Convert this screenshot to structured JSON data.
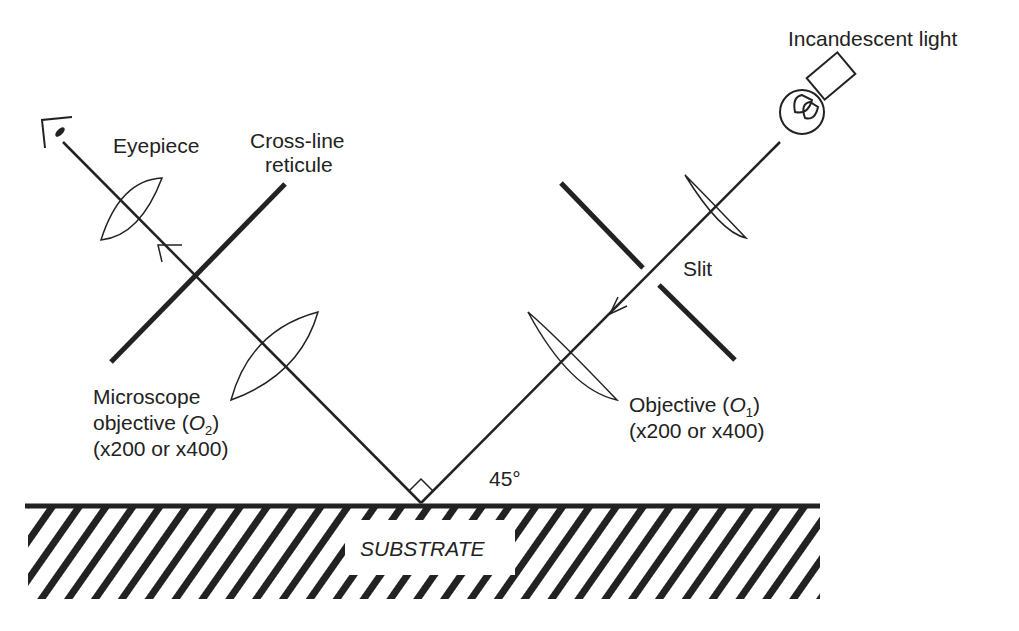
{
  "diagram": {
    "type": "optical-microscope-setup",
    "labels": {
      "incandescent_light": "Incandescent light",
      "eyepiece": "Eyepiece",
      "reticule_line1": "Cross-line",
      "reticule_line2": "reticule",
      "slit": "Slit",
      "micro_obj_line1": "Microscope",
      "micro_obj_line2_prefix": "objective (",
      "micro_obj_symbol": "O",
      "micro_obj_subscript": "2",
      "micro_obj_suffix": ")",
      "micro_obj_line3": "(x200 or x400)",
      "obj1_line1_prefix": "Objective (",
      "obj1_symbol": "O",
      "obj1_subscript": "1",
      "obj1_suffix": ")",
      "obj1_line2": "(x200 or x400)",
      "angle": "45°",
      "substrate": "SUBSTRATE"
    },
    "colors": {
      "ink": "#222222",
      "background": "#ffffff"
    }
  }
}
